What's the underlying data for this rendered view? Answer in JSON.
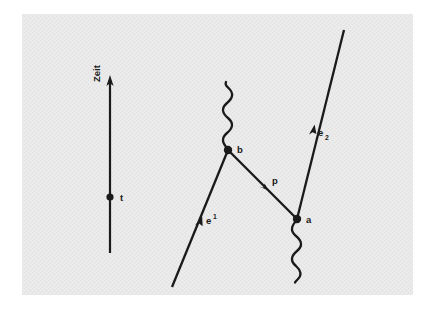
{
  "figure": {
    "kind": "feynman-diagram",
    "title_visible": false,
    "background_color": "#ffffff",
    "panel_color": "#e8e8e8",
    "ink_color": "#1a1a1a"
  },
  "axis": {
    "name": "time-axis",
    "label": "Zeit",
    "orientation": "vertical-up",
    "tick_dot_label": "t"
  },
  "vertices": [
    {
      "id": "b",
      "label": "b"
    },
    {
      "id": "a",
      "label": "a"
    }
  ],
  "lines": [
    {
      "id": "e1",
      "label": "e",
      "superscript": "1",
      "kind": "fermion"
    },
    {
      "id": "p",
      "label": "p",
      "superscript": "",
      "kind": "fermion"
    },
    {
      "id": "e2",
      "label": "e",
      "subscript": "2",
      "kind": "fermion"
    },
    {
      "id": "photon-top",
      "label": "",
      "kind": "photon"
    },
    {
      "id": "photon-bottom",
      "label": "",
      "kind": "photon"
    }
  ],
  "labels": {
    "axis_label": "Zeit",
    "time_point": "t",
    "vertex_b": "b",
    "vertex_a": "a",
    "electron_in": "e",
    "electron_in_sup": "1",
    "propagator": "p",
    "electron_out": "e",
    "electron_out_sub": "2"
  }
}
